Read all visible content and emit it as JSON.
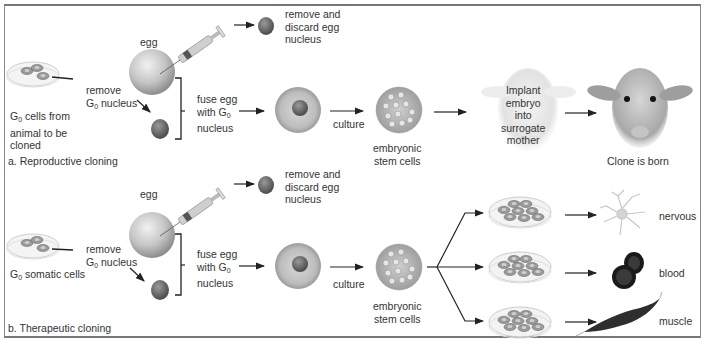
{
  "figure": {
    "panels": [
      {
        "id": "a",
        "caption": "a. Reproductive cloning",
        "source_cells": [
          "G",
          "0",
          " cells from",
          "animal to be",
          "cloned"
        ],
        "remove_nucleus": [
          "remove",
          "G",
          "0",
          " nucleus"
        ],
        "egg_label": "egg",
        "discard": [
          "remove and",
          "discard egg",
          "nucleus"
        ],
        "fuse": [
          "fuse egg",
          "with G",
          "0",
          "nucleus"
        ],
        "culture": "culture",
        "stem_cells": [
          "embryonic",
          "stem cells"
        ],
        "implant": [
          "Implant",
          "embryo",
          "into",
          "surrogate",
          "mother"
        ],
        "result": "Clone is born"
      },
      {
        "id": "b",
        "caption": "b. Therapeutic cloning",
        "source_cells": [
          "G",
          "0",
          " somatic cells"
        ],
        "remove_nucleus": [
          "remove",
          "G",
          "0",
          " nucleus"
        ],
        "egg_label": "egg",
        "discard": [
          "remove and",
          "discard egg",
          "nucleus"
        ],
        "fuse": [
          "fuse egg",
          "with G",
          "0",
          "nucleus"
        ],
        "culture": "culture",
        "stem_cells": [
          "embryonic",
          "stem cells"
        ],
        "tissues": [
          "nervous",
          "blood",
          "muscle"
        ]
      }
    ],
    "colors": {
      "frame": "#8a8a8a",
      "arrow": "#222222",
      "egg": "#b8b8b8",
      "nucleus": "#6e6e6e",
      "blood": "#1a1a1a"
    }
  }
}
